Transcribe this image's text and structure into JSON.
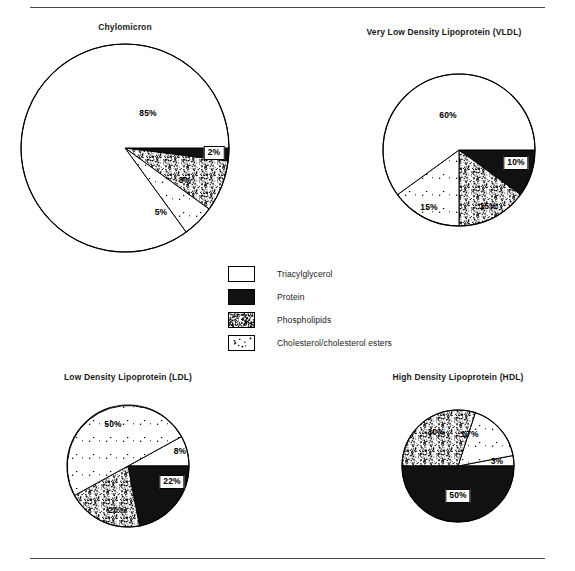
{
  "figure": {
    "rules": [
      "top-rule",
      "bottom-rule"
    ]
  },
  "legend": {
    "position": "center",
    "items": [
      {
        "key": "triacylglycerol",
        "label": "Triacylglycerol",
        "pattern": "white",
        "color": "#ffffff"
      },
      {
        "key": "protein",
        "label": "Protein",
        "pattern": "solid-black",
        "color": "#111111"
      },
      {
        "key": "phospholipids",
        "label": "Phospholipids",
        "pattern": "dense-stipple",
        "color": "#d9d9d9"
      },
      {
        "key": "cholesterol",
        "label": "Cholesterol/cholesterol esters",
        "pattern": "sparse-dots",
        "color": "#ffffff"
      }
    ]
  },
  "chart_data": [
    {
      "id": "chylomicron",
      "type": "pie",
      "title": "Chylomicron",
      "center": [
        125,
        148
      ],
      "radius": 104,
      "title_x": 125,
      "title_y": 22,
      "start_angle": 0,
      "direction": "clockwise",
      "categories": [
        "Protein",
        "Phospholipids",
        "Cholesterol/cholesterol esters",
        "Triacylglycerol"
      ],
      "values": [
        2,
        8,
        5,
        85
      ],
      "labels": [
        "2%",
        "8%",
        "5%",
        "85%"
      ],
      "patterns": [
        "solid-black",
        "dense-stipple",
        "sparse-dots",
        "white"
      ],
      "label_positions": [
        {
          "text": "2%",
          "x": 214,
          "y": 153,
          "boxed": true
        },
        {
          "text": "8%",
          "x": 185,
          "y": 180,
          "boxed": false
        },
        {
          "text": "5%",
          "x": 161,
          "y": 212,
          "boxed": false
        },
        {
          "text": "85%",
          "x": 148,
          "y": 113,
          "boxed": false
        }
      ]
    },
    {
      "id": "vldl",
      "type": "pie",
      "title": "Very Low Density Lipoprotein (VLDL)",
      "center": [
        459,
        150
      ],
      "radius": 76,
      "title_x": 444,
      "title_y": 27,
      "start_angle": 0,
      "direction": "clockwise",
      "categories": [
        "Protein",
        "Phospholipids",
        "Cholesterol/cholesterol esters",
        "Triacylglycerol"
      ],
      "values": [
        10,
        15,
        15,
        60
      ],
      "labels": [
        "10%",
        "15%",
        "15%",
        "60%"
      ],
      "patterns": [
        "solid-black",
        "dense-stipple",
        "sparse-dots",
        "white"
      ],
      "label_positions": [
        {
          "text": "10%",
          "x": 516,
          "y": 163,
          "boxed": true
        },
        {
          "text": "15%",
          "x": 488,
          "y": 206,
          "boxed": false
        },
        {
          "text": "15%",
          "x": 429,
          "y": 207,
          "boxed": false
        },
        {
          "text": "60%",
          "x": 448,
          "y": 115,
          "boxed": false
        }
      ]
    },
    {
      "id": "ldl",
      "type": "pie",
      "title": "Low Density Lipoprotein (LDL)",
      "center": [
        128,
        466
      ],
      "radius": 61,
      "title_x": 128,
      "title_y": 376,
      "start_angle": -28.8,
      "direction": "clockwise",
      "categories": [
        "Triacylglycerol",
        "Protein",
        "Phospholipids",
        "Cholesterol/cholesterol esters"
      ],
      "values": [
        8,
        22,
        20,
        50
      ],
      "labels": [
        "8%",
        "22%",
        "20%",
        "50%"
      ],
      "patterns": [
        "white",
        "solid-black",
        "dense-stipple",
        "sparse-dots"
      ],
      "label_positions": [
        {
          "text": "8%",
          "x": 180,
          "y": 451,
          "boxed": false
        },
        {
          "text": "22%",
          "x": 172,
          "y": 482,
          "boxed": true
        },
        {
          "text": "20%",
          "x": 117,
          "y": 510,
          "boxed": false
        },
        {
          "text": "50%",
          "x": 113,
          "y": 424,
          "boxed": false
        }
      ]
    },
    {
      "id": "hdl",
      "type": "pie",
      "title": "High Density Lipoprotein (HDL)",
      "center": [
        458,
        466
      ],
      "radius": 56,
      "title_x": 458,
      "title_y": 376,
      "start_angle": 0,
      "direction": "counterclockwise",
      "categories": [
        "Triacylglycerol",
        "Cholesterol/cholesterol esters",
        "Phospholipids",
        "Protein"
      ],
      "values": [
        3,
        17,
        30,
        50
      ],
      "labels": [
        "3%",
        "17%",
        "30%",
        "50%"
      ],
      "patterns": [
        "white",
        "sparse-dots",
        "dense-stipple",
        "solid-black"
      ],
      "label_positions": [
        {
          "text": "3%",
          "x": 497,
          "y": 461,
          "boxed": false
        },
        {
          "text": "17%",
          "x": 470,
          "y": 434,
          "boxed": false
        },
        {
          "text": "30%",
          "x": 436,
          "y": 432,
          "boxed": false
        },
        {
          "text": "50%",
          "x": 458,
          "y": 496,
          "boxed": true
        }
      ]
    }
  ]
}
